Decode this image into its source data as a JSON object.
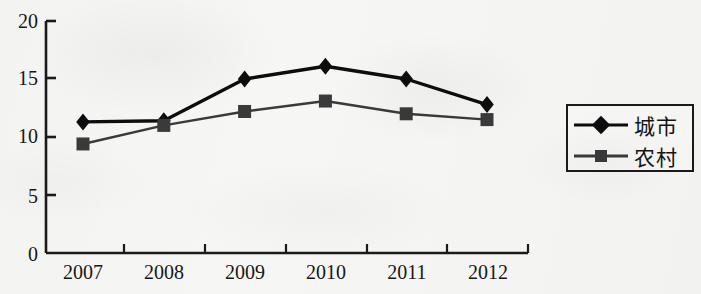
{
  "chart_data": {
    "type": "line",
    "title": "",
    "subtitle": "",
    "xlabel": "",
    "ylabel": "",
    "categories": [
      "2007",
      "2008",
      "2009",
      "2010",
      "2011",
      "2012"
    ],
    "series": [
      {
        "name": "城市",
        "marker": "diamond",
        "color": "#0d0d0d",
        "values": [
          11.3,
          11.4,
          15.0,
          16.1,
          15.0,
          12.8
        ]
      },
      {
        "name": "农村",
        "marker": "square",
        "color": "#3a3a3a",
        "values": [
          9.4,
          11.0,
          12.2,
          13.1,
          12.0,
          11.5
        ]
      }
    ],
    "ylim": [
      0,
      20
    ],
    "y_ticks": [
      0,
      5,
      10,
      15,
      20
    ],
    "y_tick_labels": [
      "0",
      "5",
      "10",
      "15",
      "20"
    ],
    "x_tick_labels": [
      "2007",
      "2008",
      "2009",
      "2010",
      "2011",
      "2012"
    ],
    "grid": false,
    "legend_position": "right"
  },
  "legend": {
    "entries": [
      {
        "label": "城市",
        "marker": "diamond-marker-icon"
      },
      {
        "label": "农村",
        "marker": "square-marker-icon"
      }
    ]
  },
  "axes": {
    "y_labels": [
      "20",
      "15",
      "10",
      "5",
      "0"
    ],
    "x_labels": [
      "2007",
      "2008",
      "2009",
      "2010",
      "2011",
      "2012"
    ]
  },
  "colors": {
    "urban_series": "#0d0d0d",
    "rural_series": "#3a3a3a",
    "axis": "#1a1a1a",
    "background": "#f6f6f4"
  }
}
